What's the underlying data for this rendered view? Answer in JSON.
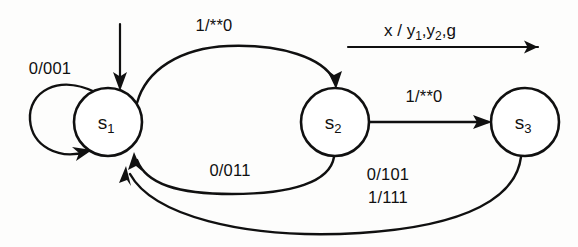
{
  "diagram": {
    "type": "finite-state-machine",
    "title": "",
    "background_color": "#fdfdfc",
    "ink_color": "#101010",
    "states": [
      {
        "id": "s1",
        "label": "s",
        "subscript": "1",
        "cx": 108,
        "cy": 122,
        "r": 34
      },
      {
        "id": "s2",
        "label": "s",
        "subscript": "2",
        "cx": 335,
        "cy": 122,
        "r": 34
      },
      {
        "id": "s3",
        "label": "s",
        "subscript": "3",
        "cx": 525,
        "cy": 122,
        "r": 34
      }
    ],
    "reset": {
      "name": "reset-arrow",
      "target": "s1"
    },
    "transitions": [
      {
        "id": "t-s1-self",
        "from": "s1",
        "to": "s1",
        "label": "0/001",
        "label_x": 50,
        "label_y": 70,
        "shape": "self-loop-left"
      },
      {
        "id": "t-s1-s2",
        "from": "s1",
        "to": "s2",
        "label": "1/**0",
        "label_x": 214,
        "label_y": 27,
        "shape": "arc-over-top"
      },
      {
        "id": "t-s2-s1",
        "from": "s2",
        "to": "s1",
        "label": "0/011",
        "label_x": 230,
        "label_y": 172,
        "shape": "arc-under-short"
      },
      {
        "id": "t-s2-s3",
        "from": "s2",
        "to": "s3",
        "label": "1/**0",
        "label_x": 424,
        "label_y": 98,
        "shape": "straight"
      },
      {
        "id": "t-s3-s1-a",
        "from": "s3",
        "to": "s1",
        "label": "0/101",
        "label_x": 388,
        "label_y": 176,
        "shape": "arc-under-long"
      },
      {
        "id": "t-s3-s1-b",
        "from": "s3",
        "to": "s1",
        "label": "1/111",
        "label_x": 388,
        "label_y": 199,
        "shape": "arc-under-long"
      }
    ],
    "legend": {
      "name": "notation-legend",
      "input": "x",
      "separator": " / ",
      "output_1": "y",
      "output_1_sub": "1",
      "output_2": "y",
      "output_2_sub": "2",
      "output_3": "g",
      "full_text": "x / y1,y2,g",
      "x": 420,
      "y": 30
    }
  }
}
